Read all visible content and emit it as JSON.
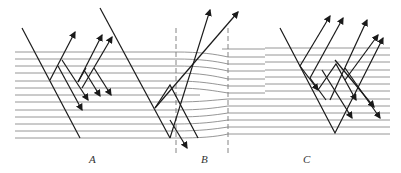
{
  "figure": {
    "panels": [
      {
        "id": "A",
        "label": "A",
        "x": 89,
        "y": 153
      },
      {
        "id": "B",
        "label": "B",
        "x": 201,
        "y": 153
      },
      {
        "id": "C",
        "label": "C",
        "x": 303,
        "y": 153
      }
    ],
    "layer_lines_y": [
      52,
      59,
      66,
      73,
      81,
      88,
      95,
      102,
      110,
      117,
      124,
      131,
      138
    ],
    "colors": {
      "layer": "#8a8a8a",
      "ray": "#1a1a1a",
      "dash": "#777777"
    }
  }
}
